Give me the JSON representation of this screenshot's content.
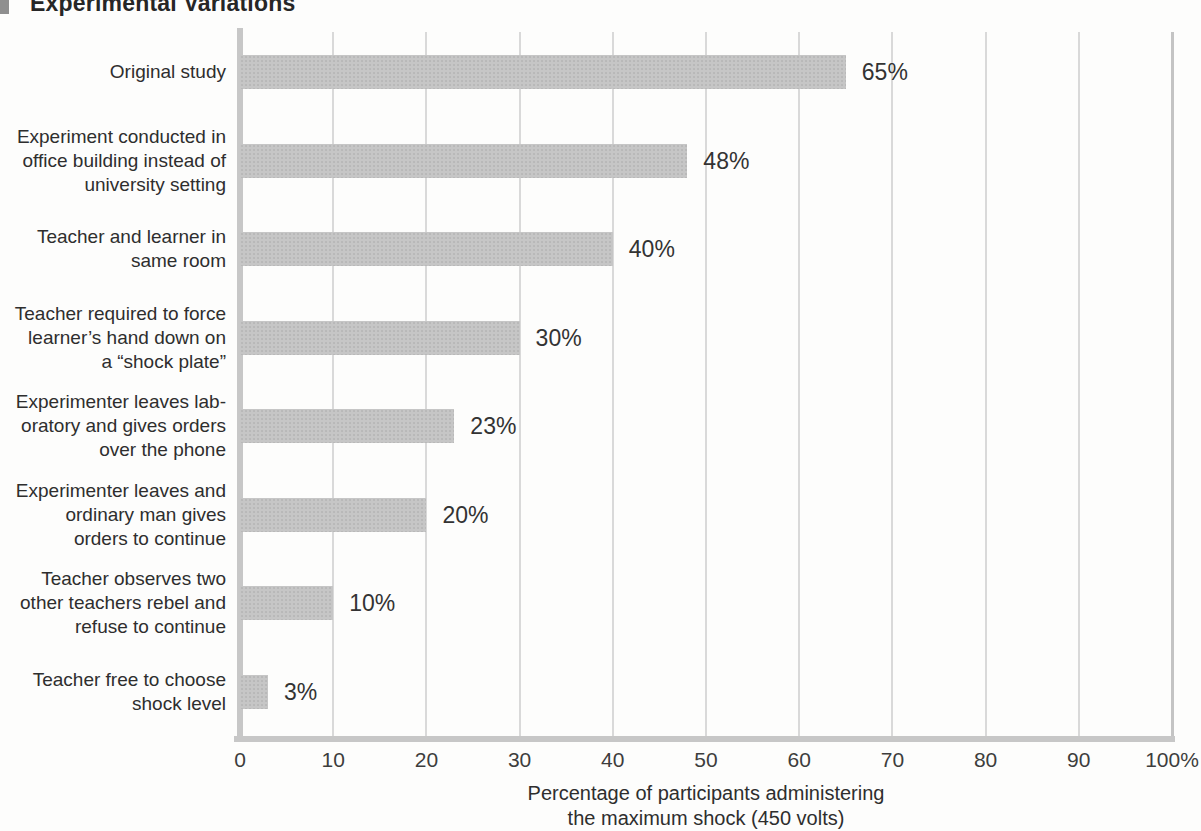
{
  "figure": {
    "title": "Experimental Variations"
  },
  "chart_data": {
    "type": "bar",
    "orientation": "horizontal",
    "title": "Experimental Variations",
    "categories": [
      "Original study",
      "Experiment conducted in\noffice building instead of\nuniversity setting",
      "Teacher and learner in\nsame room",
      "Teacher required to force\nlearner’s hand down on\na “shock plate”",
      "Experimenter leaves lab-\noratory and gives orders\nover the phone",
      "Experimenter leaves and\nordinary man gives\norders to continue",
      "Teacher observes two\nother teachers rebel and\nrefuse to continue",
      "Teacher free to choose\nshock level"
    ],
    "values": [
      65,
      48,
      40,
      30,
      23,
      20,
      10,
      3
    ],
    "value_labels": [
      "65%",
      "48%",
      "40%",
      "30%",
      "23%",
      "20%",
      "10%",
      "3%"
    ],
    "x_ticks": [
      "0",
      "10",
      "20",
      "30",
      "40",
      "50",
      "60",
      "70",
      "80",
      "90",
      "100%"
    ],
    "xlim": [
      0,
      100
    ],
    "grid": "vertical gridlines every 10 units",
    "legend": "none",
    "xlabel": "Percentage of participants administering\nthe maximum shock (450 volts)",
    "ylabel": "",
    "colors": {
      "bar": "#c6c6c6",
      "axis": "#c7c7c7",
      "right_boundary": "#c4c4c4",
      "gridline": "#d9d9d9",
      "text": "#2e2e2e"
    }
  }
}
